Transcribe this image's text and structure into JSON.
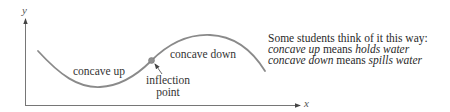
{
  "axes": {
    "x_label": "x",
    "y_label": "y"
  },
  "curve": {
    "color": "#8a8a8a",
    "labels": {
      "concave_up": "concave up",
      "concave_down": "concave down"
    },
    "inflection_point": {
      "label_line1": "inflection",
      "label_line2": "point",
      "marker_color": "#8f8f8f"
    }
  },
  "note": {
    "heading": "Some students think of it this way:",
    "line1": {
      "term": "concave up",
      "connector": " means ",
      "meaning": "holds water"
    },
    "line2": {
      "term": "concave down",
      "connector": " means ",
      "meaning": "spills water"
    }
  }
}
